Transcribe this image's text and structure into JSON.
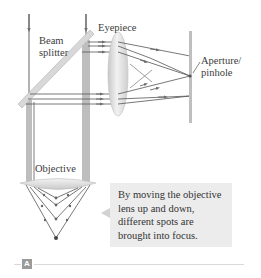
{
  "figure": {
    "labels": {
      "beam_splitter": "Beam\nsplitter",
      "beam_splitter_line1": "Beam",
      "beam_splitter_line2": "splitter",
      "eyepiece": "Eyepiece",
      "aperture_line1": "Aperture/",
      "aperture_line2": "pinhole",
      "objective": "Objective"
    },
    "callout": {
      "text": "By moving the objective lens up and down, different spots are brought into focus.",
      "line1": "By moving the objective",
      "line2": "lens up and down,",
      "line3": "different spots are",
      "line4": "brought into focus."
    },
    "panel_letter": "A",
    "colors": {
      "ray": "#555555",
      "arrowhead": "#7a7a7a",
      "lens_fill": "#dcdcdc",
      "splitter_fill": "#d6d6d6",
      "aperture_bar": "#bdbdbd",
      "callout_bg": "#ececec",
      "panel_letter_bg": "#9a9a9a"
    }
  }
}
